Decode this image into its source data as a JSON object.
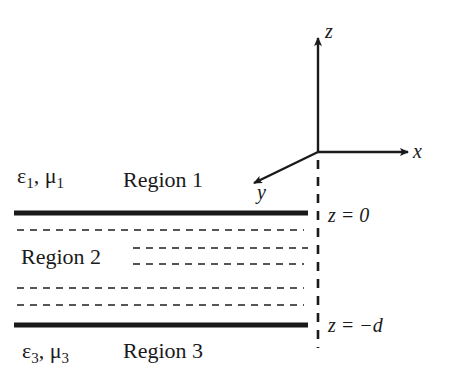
{
  "axes": {
    "z_label": "z",
    "x_label": "x",
    "y_label": "y"
  },
  "boundaries": {
    "top_label": "z = 0",
    "bottom_label": "z = −d"
  },
  "regions": {
    "region1": {
      "label": "Region 1",
      "eps": "ε",
      "eps_sub": "1",
      "mu": "μ",
      "mu_sub": "1"
    },
    "region2": {
      "label": "Region 2"
    },
    "region3": {
      "label": "Region 3",
      "eps": "ε",
      "eps_sub": "3",
      "mu": "μ",
      "mu_sub": "3"
    }
  },
  "colors": {
    "ink": "#1a1a1a",
    "dash": "#555555",
    "background": "#ffffff"
  }
}
